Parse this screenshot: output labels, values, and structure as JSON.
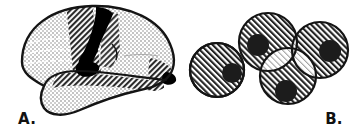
{
  "figure": {
    "background_color": "#ffffff",
    "width": 361,
    "height": 132,
    "line_color": "#141414",
    "ink_color": "#000000"
  },
  "panels": [
    {
      "id": "panel-a",
      "label": "A.",
      "subject": "lateral-brain-diagram",
      "label_position": {
        "x": 18,
        "y": 124
      },
      "regions": [
        {
          "name": "frontal-lobe",
          "fill": "stipple-light",
          "fill_color": "#d9d9d9",
          "description": "light stippled frontal region with dashed white sulcal lines"
        },
        {
          "name": "precentral-band",
          "fill": "hatch-dense",
          "fill_color": "#7a7a7a",
          "description": "dense diagonal hatched vertical band anterior to central sulcus"
        },
        {
          "name": "central-sulcus-mark",
          "fill": "solid-black",
          "fill_color": "#000000",
          "description": "thick black hook shaped sulcus marking"
        },
        {
          "name": "parietal-lobe",
          "fill": "stipple-light",
          "fill_color": "#dadada",
          "description": "light stippled parietal region"
        },
        {
          "name": "occipital-wedge",
          "fill": "hatch-dense",
          "fill_color": "#6f6f6f",
          "description": "hatched wedge at occipital pole"
        },
        {
          "name": "occipital-pole-mark",
          "fill": "solid-black",
          "fill_color": "#000000",
          "description": "small black patch at occipital tip"
        },
        {
          "name": "superior-temporal-band",
          "fill": "hatch-dense",
          "fill_color": "#8a8a8a",
          "description": "hatched band along superior temporal gyrus"
        },
        {
          "name": "temporal-lobe",
          "fill": "stipple-light",
          "fill_color": "#d9d9d9",
          "description": "light stippled inferior temporal lobe"
        },
        {
          "name": "sylvian-fissure-mark",
          "fill": "solid-black",
          "fill_color": "#000000",
          "description": "black blob marking the sylvian fissure / insula"
        }
      ]
    },
    {
      "id": "panel-b",
      "label": "B.",
      "subject": "overlapping-hatched-circles",
      "label_position": {
        "x": 334,
        "y": 124
      },
      "circle_fill": "hatch-diagonal",
      "circle_fill_color": "#8c8c8c",
      "nucleus_fill_color": "#1c1c1c",
      "overlap_fill_color": "#d2d2d2",
      "circles": [
        {
          "name": "circle-left",
          "cx": 217,
          "cy": 70,
          "r": 27,
          "nucleus_cx": 232,
          "nucleus_cy": 73,
          "nucleus_r": 10
        },
        {
          "name": "circle-upper-left",
          "cx": 268,
          "cy": 42,
          "r": 29,
          "nucleus_cx": 258,
          "nucleus_cy": 45,
          "nucleus_r": 11
        },
        {
          "name": "circle-upper-right",
          "cx": 320,
          "cy": 50,
          "r": 28,
          "nucleus_cx": 330,
          "nucleus_cy": 51,
          "nucleus_r": 11
        },
        {
          "name": "circle-lower",
          "cx": 288,
          "cy": 76,
          "r": 28,
          "nucleus_cx": 286,
          "nucleus_cy": 91,
          "nucleus_r": 11
        }
      ],
      "overlap_lenses": [
        {
          "name": "lens-upper",
          "description": "light lens between upper-left and upper-right circles"
        },
        {
          "name": "lens-left",
          "description": "light lens between upper-left and lower circles"
        },
        {
          "name": "lens-right",
          "description": "light lens between upper-right and lower circles"
        },
        {
          "name": "lens-center",
          "description": "light triple-overlap region at center"
        }
      ]
    }
  ]
}
